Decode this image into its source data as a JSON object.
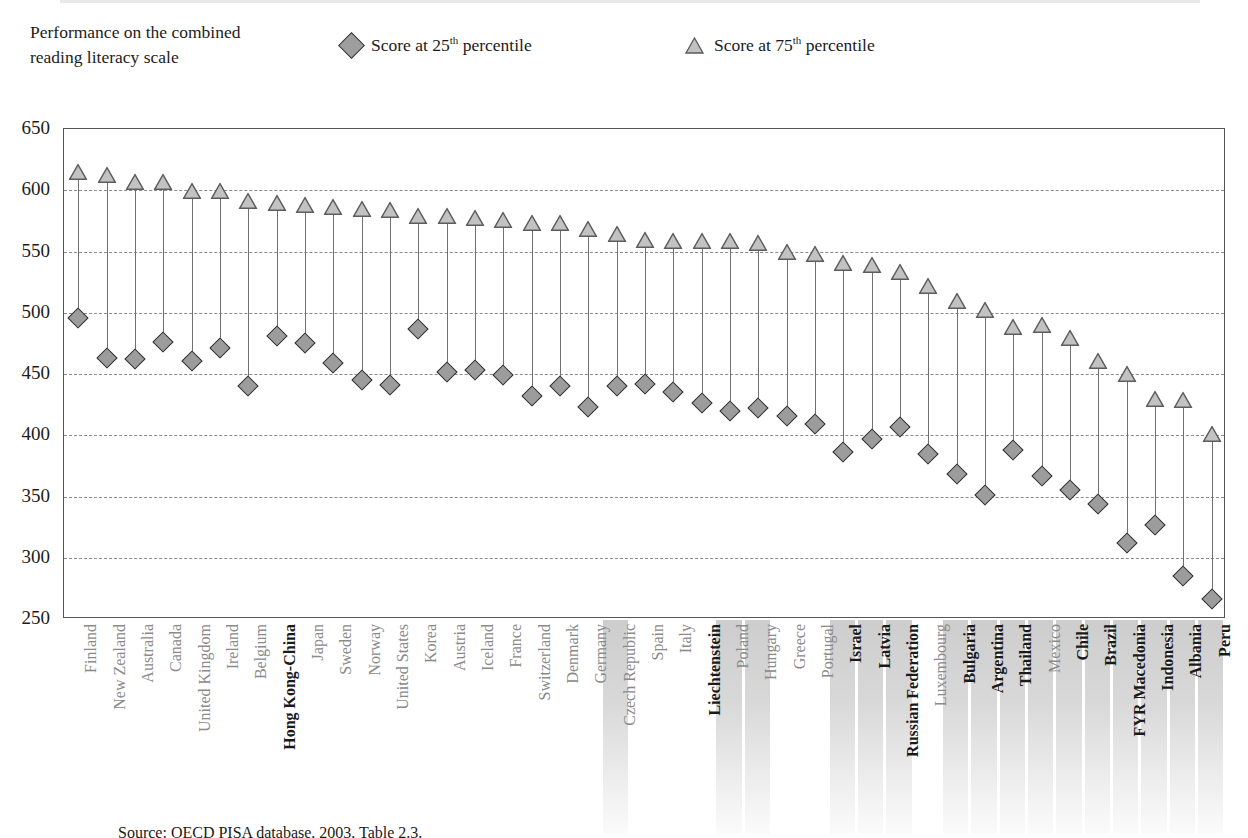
{
  "axis_title": "Performance on the combined reading literacy scale",
  "legend": {
    "p25": {
      "label_pre": "Score at 25",
      "label_sup": "th",
      "label_post": " percentile",
      "marker": "diamond",
      "color": "#9e9e9e"
    },
    "p75": {
      "label_pre": "Score at 75",
      "label_sup": "th",
      "label_post": " percentile",
      "marker": "triangle",
      "color": "#b9b9b9"
    }
  },
  "source_note": "Source: OECD PISA database, 2003, Table 2.3.",
  "chart_data": {
    "type": "scatter",
    "title": "Performance on the combined reading literacy scale",
    "xlabel": "",
    "ylabel": "Performance on the combined reading literacy scale",
    "ylim": [
      250,
      650
    ],
    "yticks": [
      250,
      300,
      350,
      400,
      450,
      500,
      550,
      600,
      650
    ],
    "grid": true,
    "legend_position": "top",
    "categories": [
      "Finland",
      "New Zealand",
      "Australia",
      "Canada",
      "United Kingdom",
      "Ireland",
      "Belgium",
      "Hong Kong-China",
      "Japan",
      "Sweden",
      "Norway",
      "United States",
      "Korea",
      "Austria",
      "Iceland",
      "France",
      "Switzerland",
      "Denmark",
      "Germany",
      "Czech Republic",
      "Spain",
      "Italy",
      "Liechtenstein",
      "Poland",
      "Hungary",
      "Greece",
      "Portugal",
      "Israel",
      "Latvia",
      "Russian Federation",
      "Luxembourg",
      "Bulgaria",
      "Argentina",
      "Thailand",
      "Mexico",
      "Chile",
      "Brazil",
      "FYR Macedonia",
      "Indonesia",
      "Albania",
      "Peru"
    ],
    "non_oecd": [
      "Hong Kong-China",
      "Liechtenstein",
      "Israel",
      "Latvia",
      "Russian Federation",
      "Bulgaria",
      "Argentina",
      "Thailand",
      "Chile",
      "Brazil",
      "FYR Macedonia",
      "Indonesia",
      "Albania",
      "Peru"
    ],
    "shaded_bands": [
      "Czech Republic",
      "Poland",
      "Hungary",
      "Israel",
      "Latvia",
      "Russian Federation",
      "Bulgaria",
      "Argentina",
      "Thailand",
      "Mexico",
      "Chile",
      "Brazil",
      "FYR Macedonia",
      "Indonesia",
      "Albania",
      "Peru"
    ],
    "series": [
      {
        "name": "Score at 25th percentile",
        "marker": "diamond",
        "values": [
          496,
          463,
          462,
          476,
          461,
          471,
          440,
          481,
          475,
          459,
          445,
          441,
          487,
          452,
          453,
          449,
          432,
          440,
          423,
          440,
          442,
          435,
          426,
          420,
          422,
          416,
          409,
          386,
          397,
          407,
          385,
          368,
          351,
          388,
          367,
          355,
          344,
          312,
          327,
          285,
          266
        ]
      },
      {
        "name": "Score at 75th percentile",
        "marker": "triangle",
        "values": [
          613,
          611,
          605,
          605,
          598,
          598,
          590,
          588,
          586,
          585,
          583,
          582,
          577,
          577,
          576,
          574,
          572,
          572,
          567,
          563,
          558,
          557,
          557,
          557,
          555,
          548,
          546,
          539,
          537,
          532,
          520,
          508,
          501,
          487,
          488,
          478,
          459,
          448,
          428,
          427,
          399
        ]
      }
    ]
  }
}
